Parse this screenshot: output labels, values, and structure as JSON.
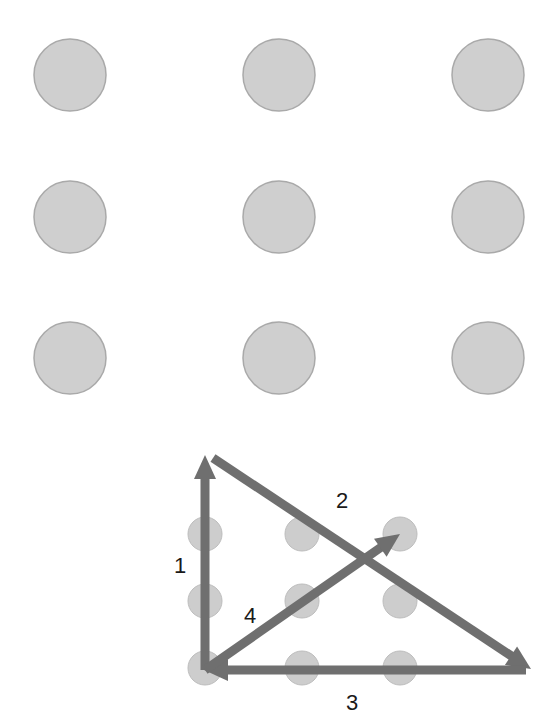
{
  "puzzle": {
    "title": "Nine-dot puzzle",
    "grid": {
      "rows": 3,
      "cols": 3,
      "x": [
        70,
        279,
        488
      ],
      "y": [
        75,
        217,
        358
      ],
      "radius": 36,
      "fill": "#cfcfcf",
      "stroke": "#a9a9a9"
    }
  },
  "solution": {
    "grid": {
      "rows": 3,
      "cols": 3,
      "x": [
        205,
        302,
        400
      ],
      "y": [
        534,
        601,
        668
      ],
      "radius": 17,
      "fill": "#cdcdcd"
    },
    "line_color": "#6f6f6f",
    "steps": [
      {
        "label": "1",
        "from": [
          205,
          670
        ],
        "to": [
          205,
          455
        ],
        "label_pos": [
          180,
          573
        ]
      },
      {
        "label": "2",
        "from": [
          213,
          458
        ],
        "to": [
          531,
          669
        ],
        "label_pos": [
          342,
          508
        ]
      },
      {
        "label": "3",
        "from": [
          526,
          670
        ],
        "to": [
          204,
          670
        ],
        "label_pos": [
          352,
          710
        ]
      },
      {
        "label": "4",
        "from": [
          205,
          670
        ],
        "to": [
          400,
          534
        ],
        "label_pos": [
          250,
          623
        ]
      }
    ]
  }
}
